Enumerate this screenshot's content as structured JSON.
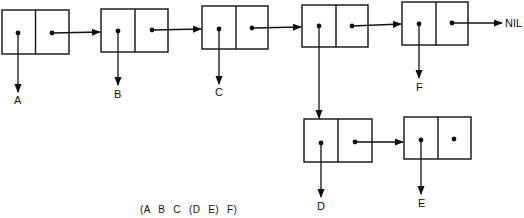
{
  "diagram": {
    "type": "lisp-list-cons-cell-diagram",
    "expression": "(A  B  C  (D  E)  F)",
    "terminator_label": "NIL",
    "top_level_atoms": [
      "A",
      "B",
      "C",
      "F"
    ],
    "sublist_atoms": [
      "D",
      "E"
    ],
    "cells": [
      {
        "id": "c1",
        "car": "A",
        "cdr": "c2"
      },
      {
        "id": "c2",
        "car": "B",
        "cdr": "c3"
      },
      {
        "id": "c3",
        "car": "C",
        "cdr": "c4"
      },
      {
        "id": "c4",
        "car": "d1",
        "cdr": "c5"
      },
      {
        "id": "c5",
        "car": "F",
        "cdr": "NIL"
      },
      {
        "id": "d1",
        "car": "D",
        "cdr": "d2"
      },
      {
        "id": "d2",
        "car": "E",
        "cdr": "(empty dot)"
      }
    ],
    "labels": {
      "a": "A",
      "b": "B",
      "c": "C",
      "d": "D",
      "e": "E",
      "f": "F",
      "nil": "NIL"
    },
    "caption": "(A  B  C  (D  E)  F)",
    "colors": {
      "stroke": "#111111",
      "background": "#ffffff"
    }
  }
}
